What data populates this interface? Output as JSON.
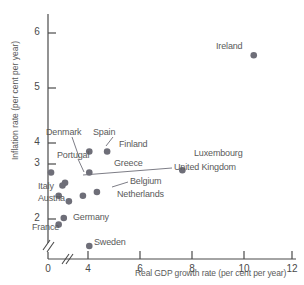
{
  "chart_data": {
    "type": "scatter",
    "title": "",
    "xlabel": "Real GDP growth rate (per cent per year)",
    "ylabel": "Inflation rate (per cent per year)",
    "xlim": [
      0,
      12.6
    ],
    "ylim": [
      1.2,
      6.4
    ],
    "x_ticks": [
      0,
      4,
      6,
      8,
      10,
      12
    ],
    "y_ticks": [
      2,
      3,
      4,
      5,
      6
    ],
    "x_axis_break": true,
    "y_axis_break": true,
    "grid": false,
    "legend": "none",
    "marker_color": "#6e6e78",
    "axis_color": "#4a4a4a",
    "points": [
      {
        "label": "Ireland",
        "x": 10.5,
        "y": 5.52
      },
      {
        "label": "Spain",
        "x": 4.05,
        "y": 3.45
      },
      {
        "label": "Finland",
        "x": 4.75,
        "y": 3.45
      },
      {
        "label": "Luxembourg",
        "x": 7.7,
        "y": 3.05
      },
      {
        "label": "Denmark",
        "x": 2.55,
        "y": 3.0
      },
      {
        "label": "Greece",
        "x": 4.05,
        "y": 3.0
      },
      {
        "label": "Portugal",
        "x": 3.1,
        "y": 2.78
      },
      {
        "label": "United Kingdom",
        "x": 3.0,
        "y": 2.72
      },
      {
        "label": "Belgium",
        "x": 4.35,
        "y": 2.58
      },
      {
        "label": "Italy",
        "x": 2.85,
        "y": 2.5
      },
      {
        "label": "Netherlands",
        "x": 3.8,
        "y": 2.5
      },
      {
        "label": "Austria",
        "x": 3.25,
        "y": 2.38
      },
      {
        "label": "Germany",
        "x": 3.05,
        "y": 2.02
      },
      {
        "label": "France",
        "x": 2.85,
        "y": 1.88
      },
      {
        "label": "Sweden",
        "x": 4.05,
        "y": 1.42
      }
    ]
  },
  "axes": {
    "x_title": "Real GDP growth rate (per cent per year)",
    "y_title": "Inflation rate (per cent per year)",
    "x_tick_labels": [
      "0",
      "4",
      "6",
      "8",
      "10",
      "12"
    ],
    "y_tick_labels": [
      "2",
      "3",
      "4",
      "5",
      "6"
    ]
  },
  "labels": {
    "ireland": "Ireland",
    "spain": "Spain",
    "finland": "Finland",
    "luxembourg": "Luxembourg",
    "denmark": "Denmark",
    "greece": "Greece",
    "portugal": "Portugal",
    "united_kingdom": "United Kingdom",
    "belgium": "Belgium",
    "italy": "Italy",
    "netherlands": "Netherlands",
    "austria": "Austria",
    "germany": "Germany",
    "france": "France",
    "sweden": "Sweden"
  }
}
